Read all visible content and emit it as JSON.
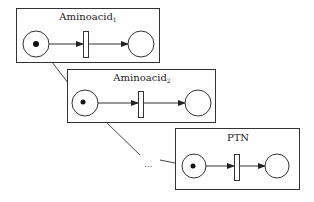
{
  "diagram": {
    "nets": [
      {
        "name": "Aminoacid",
        "subscript": "1",
        "places": [
          {
            "id": "p_in",
            "tokens": 1
          },
          {
            "id": "p_out",
            "tokens": 0
          }
        ],
        "transitions": [
          "t"
        ]
      },
      {
        "name": "Aminoacid",
        "subscript": "2",
        "places": [
          {
            "id": "p_in",
            "tokens": 1
          },
          {
            "id": "p_out",
            "tokens": 0
          }
        ],
        "transitions": [
          "t"
        ]
      },
      {
        "name": "PTN",
        "subscript": "",
        "places": [
          {
            "id": "p_in",
            "tokens": 1
          },
          {
            "id": "p_out",
            "tokens": 0
          }
        ],
        "transitions": [
          "t"
        ]
      }
    ],
    "ellipsis": "...",
    "connections": [
      {
        "from": "net-1-box",
        "to": "net-2-input-place"
      },
      {
        "from": "net-2-box",
        "to": "ellipsis"
      },
      {
        "from": "ellipsis",
        "to": "net-3-input-place"
      }
    ]
  }
}
